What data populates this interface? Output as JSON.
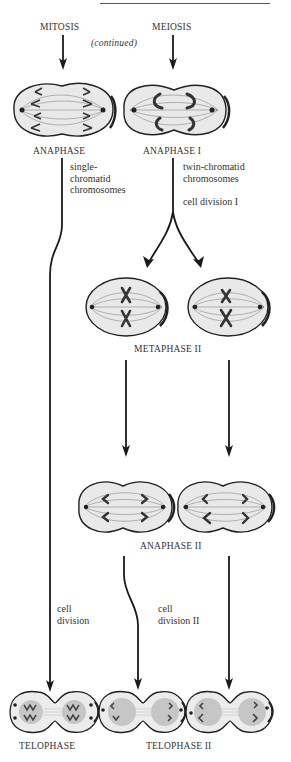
{
  "page": {
    "header_cut_text": "",
    "columns": {
      "mitosis": "MITOSIS",
      "meiosis": "MEIOSIS",
      "continued": "(continued)"
    },
    "stages": {
      "anaphase": "ANAPHASE",
      "anaphase_i": "ANAPHASE I",
      "metaphase_ii": "METAPHASE II",
      "anaphase_ii": "ANAPHASE II",
      "telophase": "TELOPHASE",
      "telophase_ii": "TELOPHASE II"
    },
    "notes": {
      "single_chromatid": [
        "single-",
        "chromatid",
        "chromosomes"
      ],
      "twin_chromatid": [
        "twin-chromatid",
        "chromosomes"
      ],
      "cell_division_i": "cell division I",
      "cell_division": [
        "cell",
        "division"
      ],
      "cell_division_ii": [
        "cell",
        "division II"
      ]
    },
    "colors": {
      "ink": "#1a1a1a",
      "cell_fill": "#ececec",
      "nucleus_fill": "#c9c9c9",
      "text": "#333333"
    }
  }
}
